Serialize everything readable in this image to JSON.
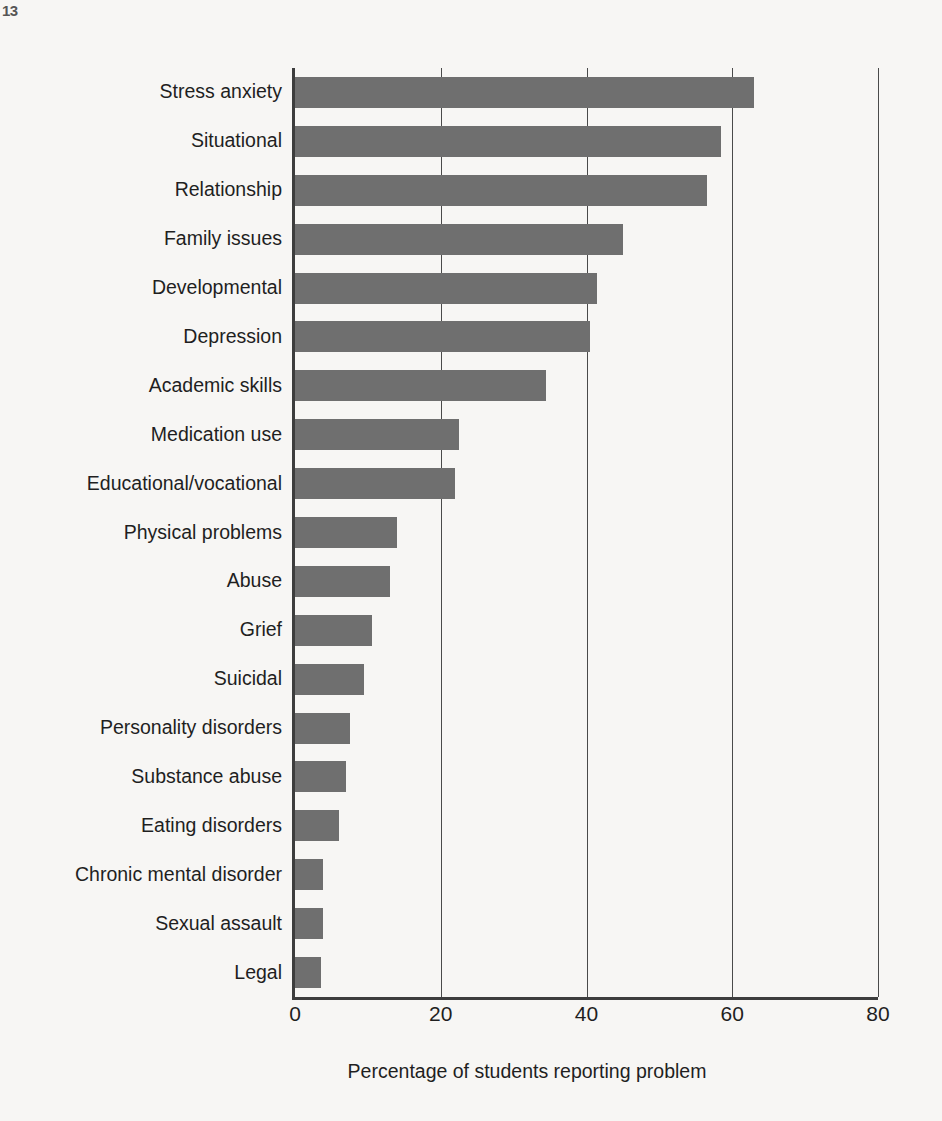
{
  "page": {
    "corner_mark": "13",
    "background_color": "#f7f6f4",
    "bar_color": "#6f6f6f",
    "axis_color": "#3d3d3d"
  },
  "chart_data": {
    "type": "bar",
    "orientation": "horizontal",
    "title": "",
    "xlabel": "Percentage of students reporting problem",
    "ylabel": "",
    "xlim": [
      0,
      80
    ],
    "xticks": [
      0,
      20,
      40,
      60,
      80
    ],
    "xticklabels": [
      "0",
      "20",
      "40",
      "60",
      "80"
    ],
    "grid": "vertical gridlines at each x tick",
    "legend": "none",
    "categories": [
      "Stress anxiety",
      "Situational",
      "Relationship",
      "Family issues",
      "Developmental",
      "Depression",
      "Academic skills",
      "Medication use",
      "Educational/vocational",
      "Physical problems",
      "Abuse",
      "Grief",
      "Suicidal",
      "Personality disorders",
      "Substance abuse",
      "Eating disorders",
      "Chronic mental disorder",
      "Sexual assault",
      "Legal"
    ],
    "values": [
      63,
      58.5,
      56.5,
      45,
      41.5,
      40.5,
      34.5,
      22.5,
      22,
      14,
      13,
      10.5,
      9.5,
      7.5,
      7,
      6,
      3.8,
      3.8,
      3.5
    ]
  }
}
